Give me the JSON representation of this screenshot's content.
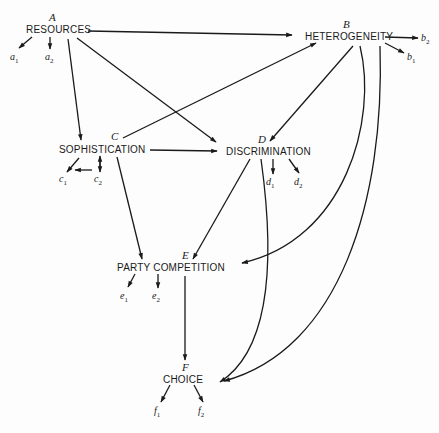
{
  "diagram": {
    "nodes": [
      {
        "id": "A",
        "letter": "A",
        "label": "RESOURCES",
        "indicators": [
          "a",
          "a"
        ]
      },
      {
        "id": "B",
        "letter": "B",
        "label": "HETEROGENEITY",
        "indicators": [
          "b",
          "b"
        ]
      },
      {
        "id": "C",
        "letter": "C",
        "label": "SOPHISTICATION",
        "indicators": [
          "c",
          "c"
        ]
      },
      {
        "id": "D",
        "letter": "D",
        "label": "DISCRIMINATION",
        "indicators": [
          "d",
          "d"
        ]
      },
      {
        "id": "E",
        "letter": "E",
        "label": "PARTY COMPETITION",
        "indicators": [
          "e",
          "e"
        ]
      },
      {
        "id": "F",
        "letter": "F",
        "label": "CHOICE",
        "indicators": [
          "f",
          "f"
        ]
      }
    ],
    "subs": [
      "1",
      "2"
    ],
    "edges": [
      [
        "A",
        "B"
      ],
      [
        "A",
        "C"
      ],
      [
        "A",
        "D"
      ],
      [
        "C",
        "B"
      ],
      [
        "C",
        "D"
      ],
      [
        "C",
        "E"
      ],
      [
        "B",
        "D"
      ],
      [
        "B",
        "E"
      ],
      [
        "B",
        "F"
      ],
      [
        "D",
        "E"
      ],
      [
        "D",
        "F"
      ],
      [
        "E",
        "F"
      ],
      [
        "c2",
        "C"
      ]
    ]
  }
}
